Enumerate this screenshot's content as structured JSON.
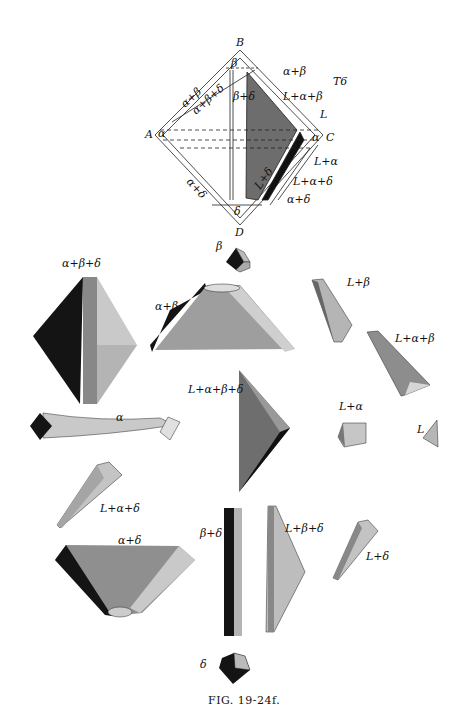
{
  "figure": {
    "caption": "FIG. 19-24f.",
    "temperature_label": "T6",
    "tetrahedron": {
      "vertices": {
        "top": "B",
        "left": "A",
        "right": "C",
        "bottom": "D"
      },
      "region_labels": [
        "β",
        "α+β",
        "L+α+β",
        "L",
        "α+β",
        "α+β+δ",
        "β+δ",
        "α",
        "α",
        "L+α",
        "L+α+δ",
        "α+δ",
        "α+δ",
        "L+δ",
        "δ",
        "L+β+δ",
        "L+β"
      ]
    }
  },
  "solids": [
    {
      "label": "β",
      "vertices": [
        "11",
        "5",
        "9",
        "8",
        "6",
        "10",
        "7"
      ]
    },
    {
      "label": "α+β+δ",
      "vertices": [
        "6",
        "10",
        "19",
        "20",
        "22",
        "13",
        "15"
      ]
    },
    {
      "label": "α+β",
      "vertices": [
        "11",
        "6",
        "10",
        "9",
        "8",
        "20",
        "22",
        "19",
        "22",
        "23",
        "24"
      ]
    },
    {
      "label": "L+β",
      "vertices": [
        "10",
        "8",
        "7",
        "3",
        "2",
        "1"
      ]
    },
    {
      "label": "L+α+β",
      "vertices": [
        "10",
        "8",
        "3",
        "24",
        "1",
        "22"
      ]
    },
    {
      "label": "L+α+β+δ",
      "vertices": [
        "10",
        "22",
        "1",
        "15"
      ]
    },
    {
      "label": "α",
      "vertices": [
        "20",
        "19",
        "21",
        "22",
        "24",
        "23",
        "25",
        "26"
      ]
    },
    {
      "label": "L+α",
      "vertices": [
        "3",
        "22",
        "24",
        "1",
        "25",
        "4"
      ]
    },
    {
      "label": "L",
      "vertices": [
        "3",
        "2",
        "1",
        "4"
      ]
    },
    {
      "label": "L+α+δ",
      "vertices": [
        "1",
        "22",
        "25",
        "4",
        "15",
        "17"
      ]
    },
    {
      "label": "α+δ",
      "vertices": [
        "19",
        "21",
        "22",
        "25",
        "26",
        "15",
        "13",
        "14",
        "18",
        "17"
      ]
    },
    {
      "label": "β+δ",
      "vertices": [
        "5",
        "15",
        "6",
        "10",
        "7",
        "13",
        "12",
        "16",
        "15"
      ]
    },
    {
      "label": "L+β+δ",
      "vertices": [
        "10",
        "7",
        "2",
        "1",
        "15",
        "16"
      ]
    },
    {
      "label": "L+δ",
      "vertices": [
        "2",
        "1",
        "4",
        "15",
        "16",
        "17"
      ]
    },
    {
      "label": "δ",
      "vertices": [
        "13",
        "15",
        "16",
        "14",
        "12",
        "17",
        "18"
      ]
    }
  ],
  "colors": {
    "dark": "#141414",
    "mid": "#7a7a7a",
    "light": "#c4c4c4",
    "pale": "#dedede",
    "line": "#222222"
  }
}
